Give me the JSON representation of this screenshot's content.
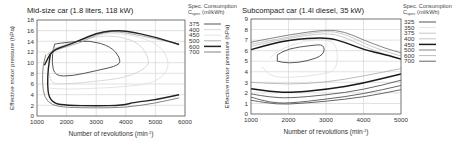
{
  "chart_data": [
    {
      "type": "line",
      "subtype": "contour",
      "title": "Mid-size car (1.8 liters, 118 kW)",
      "xlabel": "Number of revolutions (min-1)",
      "ylabel": "Effective motor pressure (hPa)",
      "xlim": [
        1000,
        6000
      ],
      "ylim": [
        0,
        18
      ],
      "xticks": [
        1000,
        2000,
        3000,
        4000,
        5000,
        6000
      ],
      "yticks": [
        0,
        2,
        4,
        6,
        8,
        10,
        12,
        14,
        16,
        18
      ],
      "grid": true,
      "legend_title": "Spec. Consumption C_spec (ml/kWh)",
      "legend_position": "right",
      "series": [
        {
          "name": "375",
          "color": "#555555",
          "width": 1.0,
          "closed": true,
          "points": [
            [
              1600,
              13.5
            ],
            [
              2000,
              13.8
            ],
            [
              2800,
              14.2
            ],
            [
              3500,
              13.0
            ],
            [
              3800,
              11.0
            ],
            [
              3800,
              9.5
            ],
            [
              3000,
              8.5
            ],
            [
              2200,
              7.5
            ],
            [
              1600,
              7.5
            ],
            [
              1500,
              10
            ],
            [
              1550,
              12.5
            ]
          ]
        },
        {
          "name": "400",
          "color": "#cfcfcf",
          "width": 0.8,
          "closed": false,
          "points": [
            [
              1500,
              12.5
            ],
            [
              2000,
              13.5
            ],
            [
              3000,
              15.0
            ],
            [
              3800,
              15.0
            ],
            [
              4500,
              13.5
            ],
            [
              4800,
              10.5
            ],
            [
              4700,
              9.0
            ],
            [
              4000,
              7.2
            ],
            [
              3000,
              6.5
            ],
            [
              2000,
              6.0
            ],
            [
              1500,
              6.0
            ],
            [
              1400,
              8
            ]
          ]
        },
        {
          "name": "450",
          "color": "#dddddd",
          "width": 0.8,
          "closed": false,
          "points": [
            [
              1450,
              11.5
            ],
            [
              2000,
              13.2
            ],
            [
              3000,
              15.3
            ],
            [
              3800,
              15.6
            ],
            [
              4700,
              14.5
            ],
            [
              5300,
              12.5
            ],
            [
              5500,
              9
            ],
            [
              5000,
              6.2
            ],
            [
              4000,
              5.5
            ],
            [
              3000,
              5.2
            ],
            [
              2000,
              5.0
            ],
            [
              1450,
              5.2
            ]
          ]
        },
        {
          "name": "500",
          "color": "#999999",
          "width": 0.8,
          "closed": false,
          "points": [
            [
              1350,
              11.5
            ],
            [
              1500,
              12.2
            ],
            [
              2000,
              13.0
            ],
            [
              2500,
              13.8
            ],
            [
              3000,
              15.2
            ],
            [
              3500,
              15.9
            ],
            [
              4000,
              15.6
            ],
            [
              5000,
              14.5
            ],
            [
              5800,
              13.5
            ]
          ]
        },
        {
          "name": "600",
          "color": "#222222",
          "width": 1.4,
          "closed": false,
          "points": [
            [
              1250,
              9.5
            ],
            [
              1500,
              12.3
            ],
            [
              2000,
              13.2
            ],
            [
              2500,
              14.3
            ],
            [
              3000,
              15.5
            ],
            [
              3500,
              16.0
            ],
            [
              4000,
              16.0
            ],
            [
              5000,
              14.8
            ],
            [
              5800,
              13.4
            ]
          ]
        },
        {
          "name": "600",
          "color": "#222222",
          "width": 1.4,
          "closed": false,
          "points": [
            [
              1450,
              11.5
            ],
            [
              1380,
              9
            ],
            [
              1350,
              6
            ],
            [
              1400,
              3.5
            ],
            [
              1600,
              2.3
            ],
            [
              2000,
              2.0
            ],
            [
              3000,
              1.9
            ],
            [
              3900,
              2.0
            ],
            [
              4300,
              2.6
            ],
            [
              5000,
              3.0
            ],
            [
              5800,
              4.0
            ]
          ]
        },
        {
          "name": "700",
          "color": "#777777",
          "width": 0.9,
          "closed": false,
          "points": [
            [
              1300,
              11.5
            ],
            [
              1200,
              9.5
            ],
            [
              1180,
              6
            ],
            [
              1250,
              3.5
            ],
            [
              1500,
              2.0
            ],
            [
              2000,
              1.6
            ],
            [
              3000,
              1.5
            ],
            [
              4000,
              1.6
            ],
            [
              5000,
              2.4
            ],
            [
              5800,
              3.4
            ]
          ]
        }
      ]
    },
    {
      "type": "line",
      "subtype": "contour",
      "title": "Subcompact car (1.4l diesel, 35 kW)",
      "xlabel": "Number of revolutions (min-1)",
      "ylabel": "Effective motor pressure (hPa)",
      "xlim": [
        1000,
        5000
      ],
      "ylim": [
        0,
        9
      ],
      "xticks": [
        1000,
        2000,
        3000,
        4000,
        5000
      ],
      "yticks": [
        0,
        1,
        2,
        3,
        4,
        5,
        6,
        7,
        8,
        9
      ],
      "grid": true,
      "legend_title": "Spec. Consumption C_spec (ml/kWh)",
      "legend_position": "right",
      "series": [
        {
          "name": "325",
          "color": "#444444",
          "width": 0.9,
          "closed": true,
          "points": [
            [
              1700,
              5.6
            ],
            [
              2000,
              6.2
            ],
            [
              2600,
              6.5
            ],
            [
              2950,
              6.6
            ],
            [
              2950,
              5.6
            ],
            [
              2500,
              5.0
            ],
            [
              2000,
              4.8
            ],
            [
              1700,
              5.0
            ]
          ]
        },
        {
          "name": "350",
          "color": "#dddddd",
          "width": 0.8,
          "closed": false,
          "points": [
            [
              1500,
              5.3
            ],
            [
              1800,
              6.2
            ],
            [
              2500,
              7.0
            ],
            [
              3000,
              7.1
            ],
            [
              3300,
              6.5
            ],
            [
              3300,
              4.3
            ],
            [
              3000,
              3.8
            ],
            [
              2000,
              3.4
            ],
            [
              1500,
              3.6
            ],
            [
              1300,
              4.5
            ]
          ]
        },
        {
          "name": "375",
          "color": "#bbbbbb",
          "width": 0.8,
          "closed": false,
          "points": [
            [
              1000,
              6.4
            ],
            [
              2000,
              7.2
            ],
            [
              3000,
              7.7
            ],
            [
              3500,
              7.3
            ],
            [
              4000,
              6.4
            ],
            [
              4600,
              5.6
            ],
            [
              5000,
              5.2
            ]
          ]
        },
        {
          "name": "400",
          "color": "#bbbbbb",
          "width": 0.8,
          "closed": false,
          "points": [
            [
              1000,
              6.6
            ],
            [
              2000,
              7.3
            ],
            [
              3000,
              7.9
            ],
            [
              3500,
              7.6
            ],
            [
              4000,
              6.7
            ],
            [
              4600,
              5.9
            ],
            [
              5000,
              5.5
            ]
          ]
        },
        {
          "name": "450",
          "color": "#1a1a1a",
          "width": 1.5,
          "closed": false,
          "points": [
            [
              1000,
              6.1
            ],
            [
              1500,
              6.6
            ],
            [
              2000,
              7.0
            ],
            [
              3000,
              7.3
            ],
            [
              3500,
              6.8
            ],
            [
              4000,
              6.1
            ],
            [
              4600,
              5.6
            ],
            [
              5000,
              5.2
            ]
          ]
        },
        {
          "name": "450",
          "color": "#1a1a1a",
          "width": 1.5,
          "closed": false,
          "points": [
            [
              1000,
              2.4
            ],
            [
              1500,
              2.15
            ],
            [
              2000,
              2.0
            ],
            [
              3000,
              2.3
            ],
            [
              4000,
              2.9
            ],
            [
              5000,
              3.8
            ]
          ]
        },
        {
          "name": "500",
          "color": "#777777",
          "width": 0.9,
          "closed": false,
          "points": [
            [
              1000,
              6.8
            ],
            [
              2000,
              7.5
            ],
            [
              3000,
              8.0
            ],
            [
              3500,
              7.8
            ],
            [
              4000,
              7.0
            ],
            [
              4600,
              6.2
            ],
            [
              5000,
              5.8
            ]
          ]
        },
        {
          "name": "600",
          "color": "#aaaaaa",
          "width": 0.8,
          "closed": false,
          "points": [
            [
              1000,
              3.0
            ],
            [
              2000,
              2.8
            ],
            [
              3000,
              3.0
            ],
            [
              4000,
              3.6
            ],
            [
              5000,
              4.3
            ]
          ]
        },
        {
          "name": "700",
          "color": "#555555",
          "width": 0.9,
          "closed": false,
          "points": [
            [
              1000,
              1.9
            ],
            [
              1500,
              1.6
            ],
            [
              2000,
              1.5
            ],
            [
              3000,
              1.8
            ],
            [
              4000,
              2.3
            ],
            [
              5000,
              3.2
            ]
          ]
        },
        {
          "name": "700",
          "color": "#555555",
          "width": 0.9,
          "closed": false,
          "points": [
            [
              1000,
              1.6
            ],
            [
              1500,
              1.1
            ],
            [
              2000,
              1.0
            ],
            [
              3000,
              1.4
            ],
            [
              4000,
              1.9
            ],
            [
              5000,
              2.7
            ]
          ]
        },
        {
          "name": "700",
          "color": "#555555",
          "width": 0.9,
          "closed": false,
          "points": [
            [
              1000,
              1.3
            ],
            [
              1700,
              0.9
            ],
            [
              2300,
              1.0
            ],
            [
              3000,
              1.2
            ],
            [
              4000,
              1.6
            ],
            [
              5000,
              2.3
            ]
          ]
        }
      ]
    }
  ],
  "left": {
    "title": "Mid-size car (1.8 liters, 118 kW)",
    "legend_line1": "Spec. Consumption",
    "legend_c": "C",
    "legend_sub": "spec",
    "legend_unit": " (ml/kWh)",
    "ylabel": "Effective motor pressure (hPa)",
    "xlabel_main": "Number of revolutions (min",
    "xlabel_sup": "-1",
    "xlabel_end": ")",
    "legend": [
      {
        "label": "375",
        "color": "#555555",
        "width": 1.0
      },
      {
        "label": "400",
        "color": "#cfcfcf",
        "width": 0.8
      },
      {
        "label": "450",
        "color": "#dddddd",
        "width": 0.8
      },
      {
        "label": "500",
        "color": "#999999",
        "width": 0.8
      },
      {
        "label": "600",
        "color": "#222222",
        "width": 1.5
      },
      {
        "label": "700",
        "color": "#777777",
        "width": 0.9
      }
    ]
  },
  "right": {
    "title": "Subcompact car (1.4l diesel, 35 kW)",
    "legend_line1": "Spec. Consumption",
    "legend_c": "C",
    "legend_sub": "spec",
    "legend_unit": " (ml/kWh)",
    "ylabel": "Effective motor pressure (hPa)",
    "xlabel_main": "Number of revolutions (min",
    "xlabel_sup": "-1",
    "xlabel_end": ")",
    "legend": [
      {
        "label": "325",
        "color": "#444444",
        "width": 0.9
      },
      {
        "label": "350",
        "color": "#dddddd",
        "width": 0.8
      },
      {
        "label": "375",
        "color": "#bbbbbb",
        "width": 0.8
      },
      {
        "label": "400",
        "color": "#bbbbbb",
        "width": 0.8
      },
      {
        "label": "450",
        "color": "#1a1a1a",
        "width": 1.5
      },
      {
        "label": "500",
        "color": "#777777",
        "width": 0.9
      },
      {
        "label": "600",
        "color": "#aaaaaa",
        "width": 0.8
      },
      {
        "label": "700",
        "color": "#555555",
        "width": 0.9
      }
    ]
  }
}
